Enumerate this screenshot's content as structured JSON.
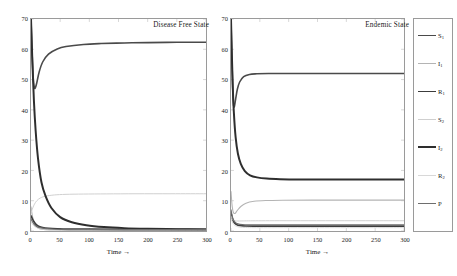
{
  "figure": {
    "panels": [
      {
        "id": "disease-free",
        "title": "Disease Free State",
        "xlabel": "Time →",
        "ylabel": "All Population →"
      },
      {
        "id": "endemic",
        "title": "Endemic State",
        "xlabel": "Time →",
        "ylabel": "All Population →"
      }
    ],
    "xticks": [
      "0",
      "50",
      "100",
      "150",
      "200",
      "250",
      "300"
    ],
    "yticks": [
      "0",
      "10",
      "20",
      "30",
      "40",
      "50",
      "60",
      "70"
    ]
  },
  "legend": {
    "entries": [
      {
        "label": "S",
        "sub": "1",
        "color": "#4a4a4a",
        "width": 1.6
      },
      {
        "label": "I",
        "sub": "1",
        "color": "#b4b4b4",
        "width": 1.1
      },
      {
        "label": "R",
        "sub": "1",
        "color": "#3c3c3c",
        "width": 1.7
      },
      {
        "label": "S",
        "sub": "2",
        "color": "#cfcfcf",
        "width": 1.0
      },
      {
        "label": "I",
        "sub": "2",
        "color": "#2e2e2e",
        "width": 2.0
      },
      {
        "label": "R",
        "sub": "2",
        "color": "#d8d8d8",
        "width": 1.0
      },
      {
        "label": "P",
        "sub": "",
        "color": "#6e6e6e",
        "width": 1.2
      }
    ]
  },
  "chart_data": [
    {
      "type": "line",
      "title": "Disease Free State",
      "xlabel": "Time →",
      "ylabel": "All Population →",
      "xlim": [
        0,
        300
      ],
      "ylim": [
        0,
        70
      ],
      "xticks": [
        0,
        50,
        100,
        150,
        200,
        250,
        300
      ],
      "yticks": [
        0,
        10,
        20,
        30,
        40,
        50,
        60,
        70
      ],
      "grid": false,
      "legend_position": "outside-right",
      "series": [
        {
          "name": "S1",
          "color": "#4a4a4a",
          "initial": 70,
          "minimum": 47,
          "steady_state": 62,
          "x": [
            0,
            2,
            4,
            6,
            8,
            10,
            14,
            20,
            30,
            45,
            60,
            90,
            120,
            160,
            200,
            250,
            300
          ],
          "values": [
            70,
            58,
            50,
            47.2,
            47.6,
            49,
            52.5,
            55.8,
            58.4,
            60.1,
            60.9,
            61.6,
            61.9,
            62.1,
            62.2,
            62.3,
            62.3
          ]
        },
        {
          "name": "I1",
          "color": "#b4b4b4",
          "initial": 8,
          "steady_state": 0.2,
          "x": [
            0,
            2,
            4,
            6,
            8,
            12,
            18,
            25,
            40,
            60,
            90,
            130,
            180,
            240,
            300
          ],
          "values": [
            8,
            5.4,
            3.6,
            2.5,
            1.8,
            1.0,
            0.62,
            0.45,
            0.32,
            0.27,
            0.23,
            0.21,
            0.2,
            0.2,
            0.2
          ]
        },
        {
          "name": "R1",
          "color": "#3c3c3c",
          "initial": 5,
          "steady_state": 0.55,
          "x": [
            0,
            2,
            4,
            6,
            9,
            13,
            20,
            30,
            45,
            70,
            100,
            150,
            210,
            300
          ],
          "values": [
            5,
            4.2,
            3.4,
            2.8,
            2.1,
            1.6,
            1.15,
            0.9,
            0.75,
            0.66,
            0.61,
            0.57,
            0.55,
            0.55
          ]
        },
        {
          "name": "S2",
          "color": "#cfcfcf",
          "initial": 6,
          "steady_state": 12.3,
          "x": [
            0,
            3,
            6,
            10,
            16,
            25,
            40,
            60,
            90,
            130,
            180,
            240,
            300
          ],
          "values": [
            6,
            7.6,
            8.9,
            10.0,
            10.9,
            11.5,
            11.9,
            12.1,
            12.2,
            12.25,
            12.3,
            12.3,
            12.3
          ]
        },
        {
          "name": "I2",
          "color": "#2e2e2e",
          "initial": 70,
          "steady_state": 0.5,
          "x": [
            0,
            2,
            5,
            8,
            12,
            18,
            25,
            35,
            50,
            70,
            95,
            125,
            160,
            200,
            250,
            300
          ],
          "values": [
            70,
            58,
            43,
            33,
            24,
            16,
            11.5,
            7.6,
            4.6,
            2.9,
            1.9,
            1.3,
            0.95,
            0.75,
            0.6,
            0.5
          ]
        },
        {
          "name": "R2",
          "color": "#d8d8d8",
          "initial": 3,
          "steady_state": 0.3,
          "x": [
            0,
            2,
            5,
            9,
            15,
            24,
            38,
            60,
            95,
            150,
            220,
            300
          ],
          "values": [
            3,
            2.4,
            1.7,
            1.2,
            0.82,
            0.58,
            0.44,
            0.36,
            0.32,
            0.3,
            0.3,
            0.3
          ]
        },
        {
          "name": "P",
          "color": "#6e6e6e",
          "initial": 4,
          "steady_state": 0.4,
          "x": [
            0,
            2,
            5,
            9,
            15,
            25,
            40,
            65,
            100,
            150,
            220,
            300
          ],
          "values": [
            4,
            3.2,
            2.3,
            1.6,
            1.1,
            0.76,
            0.58,
            0.47,
            0.42,
            0.4,
            0.4,
            0.4
          ]
        }
      ]
    },
    {
      "type": "line",
      "title": "Endemic State",
      "xlabel": "Time →",
      "ylabel": "All Population →",
      "xlim": [
        0,
        300
      ],
      "ylim": [
        0,
        70
      ],
      "xticks": [
        0,
        50,
        100,
        150,
        200,
        250,
        300
      ],
      "yticks": [
        0,
        10,
        20,
        30,
        40,
        50,
        60,
        70
      ],
      "grid": false,
      "legend_position": "outside-right",
      "series": [
        {
          "name": "S1",
          "color": "#4a4a4a",
          "initial": 70,
          "minimum": 41,
          "steady_state": 52,
          "x": [
            0,
            1.5,
            3,
            4.5,
            6,
            8,
            11,
            15,
            22,
            32,
            45,
            65,
            95,
            140,
            200,
            260,
            300
          ],
          "values": [
            70,
            57,
            47,
            41.5,
            41.2,
            43.5,
            46.8,
            49.2,
            51.0,
            51.7,
            51.9,
            52.0,
            52.0,
            52.0,
            52.0,
            52.0,
            52.0
          ]
        },
        {
          "name": "I1",
          "color": "#b4b4b4",
          "initial": 13,
          "steady_state": 10.2,
          "x": [
            0,
            2,
            4,
            7,
            11,
            17,
            26,
            40,
            60,
            90,
            140,
            200,
            260,
            300
          ],
          "values": [
            13,
            8.2,
            6.2,
            5.8,
            6.8,
            8.1,
            9.2,
            9.8,
            10.05,
            10.15,
            10.2,
            10.2,
            10.2,
            10.2
          ]
        },
        {
          "name": "R1",
          "color": "#3c3c3c",
          "initial": 6,
          "steady_state": 1.6,
          "x": [
            0,
            2,
            4,
            7,
            11,
            17,
            26,
            40,
            60,
            95,
            150,
            220,
            300
          ],
          "values": [
            6,
            4.4,
            3.3,
            2.5,
            2.0,
            1.76,
            1.66,
            1.62,
            1.6,
            1.6,
            1.6,
            1.6,
            1.6
          ]
        },
        {
          "name": "S2",
          "color": "#cfcfcf",
          "initial": 5,
          "steady_state": 3.4,
          "x": [
            0,
            2,
            4,
            7,
            12,
            19,
            30,
            48,
            75,
            120,
            180,
            250,
            300
          ],
          "values": [
            5,
            4.1,
            3.6,
            3.35,
            3.3,
            3.32,
            3.36,
            3.38,
            3.4,
            3.4,
            3.4,
            3.4,
            3.4
          ]
        },
        {
          "name": "I2",
          "color": "#2e2e2e",
          "initial": 70,
          "steady_state": 17,
          "x": [
            0,
            1.5,
            3,
            5,
            8,
            12,
            17,
            24,
            33,
            45,
            62,
            85,
            120,
            170,
            230,
            300
          ],
          "values": [
            70,
            58,
            48,
            39,
            31,
            25.5,
            22.2,
            19.8,
            18.4,
            17.7,
            17.3,
            17.1,
            17.0,
            17.0,
            17.0,
            17.0
          ]
        },
        {
          "name": "R2",
          "color": "#d8d8d8",
          "initial": 4,
          "steady_state": 1.1,
          "x": [
            0,
            2,
            4,
            7,
            12,
            20,
            32,
            50,
            80,
            130,
            200,
            300
          ],
          "values": [
            4,
            3.1,
            2.4,
            1.8,
            1.4,
            1.2,
            1.12,
            1.1,
            1.1,
            1.1,
            1.1,
            1.1
          ]
        },
        {
          "name": "P",
          "color": "#6e6e6e",
          "initial": 7,
          "steady_state": 2.0,
          "x": [
            0,
            2,
            4,
            7,
            12,
            20,
            32,
            52,
            85,
            135,
            205,
            300
          ],
          "values": [
            7,
            5.0,
            3.8,
            2.9,
            2.35,
            2.1,
            2.02,
            2.0,
            2.0,
            2.0,
            2.0,
            2.0
          ]
        }
      ]
    }
  ]
}
